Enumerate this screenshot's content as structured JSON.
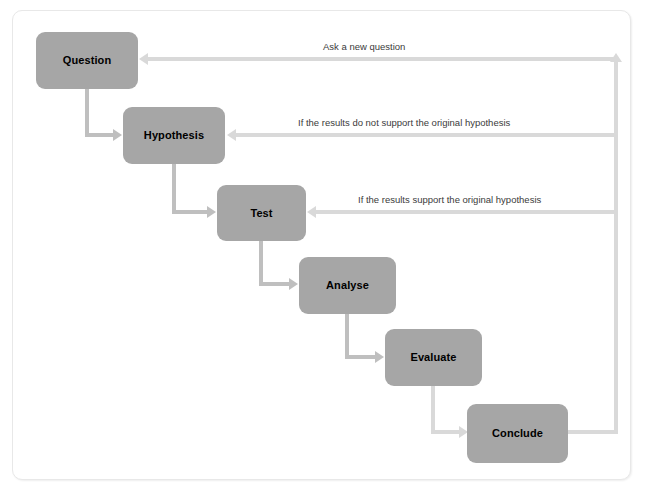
{
  "diagram": {
    "type": "flowchart",
    "colors": {
      "node_fill": "#a6a6a6",
      "node_text": "#000000",
      "connector": "#bfbfbf",
      "feedback_connector": "#d9d9d9",
      "card_background": "#ffffff",
      "card_border": "#e8e8e8",
      "label_text": "#3b3b3b"
    },
    "nodes": [
      {
        "id": "question",
        "label": "Question"
      },
      {
        "id": "hypothesis",
        "label": "Hypothesis"
      },
      {
        "id": "test",
        "label": "Test"
      },
      {
        "id": "analyse",
        "label": "Analyse"
      },
      {
        "id": "evaluate",
        "label": "Evaluate"
      },
      {
        "id": "conclude",
        "label": "Conclude"
      }
    ],
    "feedback_labels": [
      {
        "id": "ask-new-question",
        "text": "Ask a new question"
      },
      {
        "id": "not-support",
        "text": "If the results do not support the original hypothesis"
      },
      {
        "id": "support",
        "text": "If the results support the original hypothesis"
      }
    ],
    "sequence_arrows": [
      {
        "from": "question",
        "to": "hypothesis"
      },
      {
        "from": "hypothesis",
        "to": "test"
      },
      {
        "from": "test",
        "to": "analyse"
      },
      {
        "from": "analyse",
        "to": "evaluate"
      },
      {
        "from": "evaluate",
        "to": "conclude"
      }
    ],
    "feedback_arrows": [
      {
        "from": "conclude",
        "to": "question",
        "label": "Ask a new question"
      },
      {
        "from": "conclude",
        "to": "hypothesis",
        "label": "If the results do not support the original hypothesis"
      },
      {
        "from": "conclude",
        "to": "test",
        "label": "If the results support the original hypothesis"
      }
    ]
  }
}
